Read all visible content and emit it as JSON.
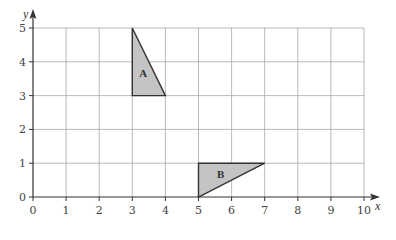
{
  "diagram": {
    "type": "coordinate-grid",
    "x_axis": {
      "label": "x",
      "min": 0,
      "max": 10,
      "ticks": [
        "0",
        "1",
        "2",
        "3",
        "4",
        "5",
        "6",
        "7",
        "8",
        "9",
        "10"
      ]
    },
    "y_axis": {
      "label": "y",
      "min": 0,
      "max": 5,
      "ticks": [
        "0",
        "1",
        "2",
        "3",
        "4",
        "5"
      ]
    },
    "shapes": [
      {
        "name": "A",
        "label": "A",
        "vertices": [
          [
            3,
            5
          ],
          [
            3,
            3
          ],
          [
            4,
            3
          ]
        ],
        "fill": "#c4c4c4"
      },
      {
        "name": "B",
        "label": "B",
        "vertices": [
          [
            5,
            1
          ],
          [
            7,
            1
          ],
          [
            5,
            0
          ]
        ],
        "fill": "#c4c4c4"
      }
    ]
  }
}
